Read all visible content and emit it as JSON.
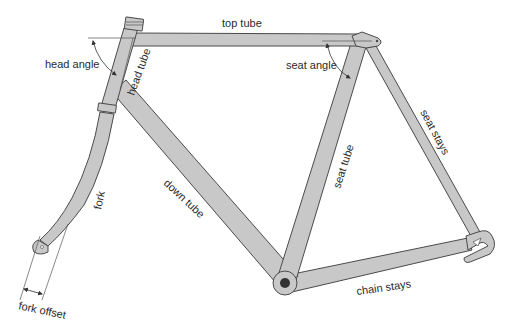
{
  "diagram": {
    "colors": {
      "tube_fill": "#c8c8c8",
      "tube_stroke": "#4a4a4a",
      "text": "#2a2a2a",
      "background": "#ffffff"
    },
    "labels": {
      "top_tube": "top tube",
      "head_angle": "head angle",
      "head_tube": "head tube",
      "seat_angle": "seat angle",
      "seat_stays": "seat stays",
      "seat_tube": "seat tube",
      "down_tube": "down tube",
      "fork": "fork",
      "chain_stays": "chain stays",
      "fork_offset": "fork offset"
    }
  }
}
